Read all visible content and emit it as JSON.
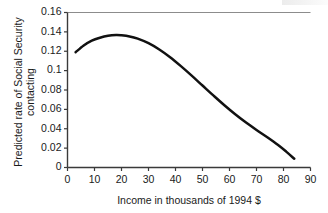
{
  "chart_data": {
    "type": "line",
    "title": "",
    "xlabel": "Income in thousands of 1994 $",
    "ylabel": "Predicted rate of Social Security contacting",
    "ylabel_lines": [
      "Predicted rate of Social Security",
      "contacting"
    ],
    "xlim": [
      0,
      90
    ],
    "ylim": [
      0,
      0.16
    ],
    "grid": false,
    "legend": false,
    "xticks": [
      0,
      10,
      20,
      30,
      40,
      50,
      60,
      70,
      80,
      90
    ],
    "xtick_labels": [
      "0",
      "10",
      "20",
      "30",
      "40",
      "50",
      "60",
      "70",
      "80",
      "90"
    ],
    "yticks": [
      0,
      0.02,
      0.04,
      0.06,
      0.08,
      0.1,
      0.12,
      0.14,
      0.16
    ],
    "ytick_labels": [
      "0",
      "0.02",
      "0.04",
      "0.06",
      "0.08",
      "0.1",
      "0.12",
      "0.14",
      "0.16"
    ],
    "series": [
      {
        "name": "Predicted rate of Social Security contacting",
        "color": "#111111",
        "x": [
          3,
          6,
          9,
          12,
          15,
          18,
          20,
          23,
          26,
          30,
          34,
          38,
          42,
          46,
          50,
          54,
          58,
          62,
          66,
          70,
          74,
          78,
          81,
          84
        ],
        "y": [
          0.119,
          0.126,
          0.131,
          0.134,
          0.136,
          0.1368,
          0.1365,
          0.1353,
          0.133,
          0.1283,
          0.1218,
          0.1138,
          0.1046,
          0.0948,
          0.0846,
          0.0744,
          0.0645,
          0.0552,
          0.0466,
          0.0387,
          0.0312,
          0.0232,
          0.0164,
          0.009
        ]
      }
    ]
  },
  "axes": {
    "x_title": "Income in thousands of 1994 $",
    "y_title_line1": "Predicted rate of Social Security",
    "y_title_line2": "contacting"
  },
  "colors": {
    "curve": "#111111",
    "axis": "#3a3a3a",
    "top_border": "#8c8c8c",
    "background": "#ffffff",
    "text": "#1a1a1a"
  }
}
